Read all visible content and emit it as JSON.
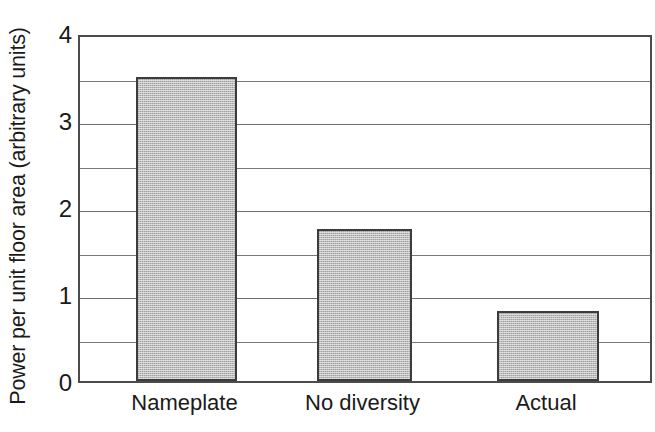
{
  "chart_data": {
    "type": "bar",
    "title": "",
    "subtitle": "",
    "xlabel": "",
    "ylabel": "Power per unit floor area (arbitrary units)",
    "categories": [
      "Nameplate",
      "No diversity",
      "Actual"
    ],
    "values": [
      3.5,
      1.75,
      0.8
    ],
    "series": [
      {
        "name": "Power per unit floor area",
        "values": [
          3.5,
          1.75,
          0.8
        ]
      }
    ],
    "ylim": [
      0,
      4
    ],
    "y_major_ticks": [
      0,
      1,
      2,
      3,
      4
    ],
    "y_major_tick_labels": [
      "0",
      "1",
      "2",
      "3",
      "4"
    ],
    "y_minor_ticks": [
      0.5,
      1.5,
      2.5,
      3.5
    ],
    "grid": "horizontal",
    "legend": "none",
    "annotations": [],
    "colors": {
      "bar_fill": "#bdbdbd",
      "bar_edge": "#3c3c3c",
      "gridline": "#6e6e6e",
      "axis": "#4b4b4b",
      "text": "#1a1a1a",
      "background": "#ffffff"
    }
  },
  "axis": {
    "y_title": "Power per unit floor area (arbitrary units)",
    "y_ticks": [
      {
        "label": "4",
        "value": 4
      },
      {
        "label": "3",
        "value": 3
      },
      {
        "label": "2",
        "value": 2
      },
      {
        "label": "1",
        "value": 1
      },
      {
        "label": "0",
        "value": 0
      }
    ],
    "x_ticks": [
      {
        "label": "Nameplate"
      },
      {
        "label": "No diversity"
      },
      {
        "label": "Actual"
      }
    ]
  }
}
